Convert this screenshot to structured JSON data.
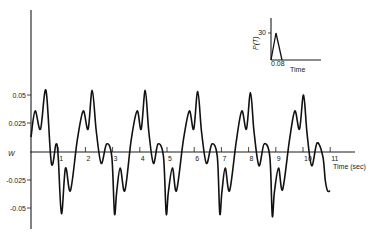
{
  "chart_data": {
    "type": "line",
    "title": "",
    "xlabel": "Time (sec)",
    "ylabel": "W",
    "xlim": [
      0,
      11
    ],
    "ylim": [
      -0.06,
      0.06
    ],
    "grid": false,
    "legend": null,
    "x_ticks": [
      "1",
      "2",
      "3",
      "4",
      "5",
      "6",
      "7",
      "8",
      "9",
      "10",
      "11"
    ],
    "y_ticks": [
      "0.05",
      "0.025",
      "-0.025",
      "-0.05"
    ],
    "series": [
      {
        "name": "W",
        "x": [
          0.0,
          0.15,
          0.35,
          0.55,
          0.75,
          0.92,
          1.0,
          1.12,
          1.27,
          1.45,
          1.7,
          1.92,
          2.1,
          2.25,
          2.4,
          2.58,
          2.78,
          2.97,
          3.07,
          3.15,
          3.28,
          3.45,
          3.68,
          3.9,
          4.05,
          4.2,
          4.33,
          4.5,
          4.67,
          4.87,
          4.97,
          5.05,
          5.2,
          5.35,
          5.6,
          5.82,
          5.98,
          6.13,
          6.27,
          6.45,
          6.65,
          6.85,
          6.94,
          7.02,
          7.14,
          7.3,
          7.55,
          7.75,
          7.92,
          8.07,
          8.2,
          8.38,
          8.57,
          8.78,
          8.87,
          8.95,
          9.1,
          9.25,
          9.5,
          9.7,
          9.87,
          10.02,
          10.15,
          10.32,
          10.52,
          10.73,
          10.82,
          10.9,
          11.0
        ],
        "y": [
          0.013,
          0.036,
          0.02,
          0.054,
          -0.01,
          0.007,
          -0.004,
          -0.054,
          -0.014,
          -0.034,
          0.01,
          0.036,
          0.02,
          0.054,
          0.018,
          -0.01,
          0.007,
          -0.004,
          -0.054,
          -0.035,
          -0.014,
          -0.034,
          0.01,
          0.036,
          0.02,
          0.054,
          0.018,
          -0.01,
          0.007,
          -0.004,
          -0.054,
          -0.035,
          -0.014,
          -0.034,
          0.01,
          0.036,
          0.02,
          0.053,
          0.018,
          -0.01,
          0.007,
          -0.004,
          -0.054,
          -0.035,
          -0.014,
          -0.034,
          0.01,
          0.036,
          0.02,
          0.052,
          0.018,
          -0.012,
          0.007,
          -0.004,
          -0.056,
          -0.035,
          -0.014,
          -0.033,
          0.01,
          0.036,
          0.02,
          0.05,
          0.016,
          -0.012,
          0.008,
          -0.004,
          -0.025,
          -0.034,
          -0.034
        ]
      }
    ],
    "inset": {
      "type": "line",
      "ylabel": "P(T)",
      "xlabel": "Time",
      "y_tick": "30",
      "x_tick": "0.08",
      "description": "triangular pulse load rising to 30 then returning to 0 at 0.08"
    }
  },
  "labels": {
    "ylabel": "W",
    "xlabel": "Time (sec)",
    "y_ticks": [
      "0.05",
      "0.025",
      "-0.025",
      "-0.05"
    ],
    "x_ticks": [
      "1",
      "2",
      "3",
      "4",
      "5",
      "6",
      "7",
      "8",
      "9",
      "10",
      "11"
    ],
    "inset_ylabel": "P(T)",
    "inset_xlabel": "Time",
    "inset_ytick": "30",
    "inset_xtick": "0.08"
  }
}
